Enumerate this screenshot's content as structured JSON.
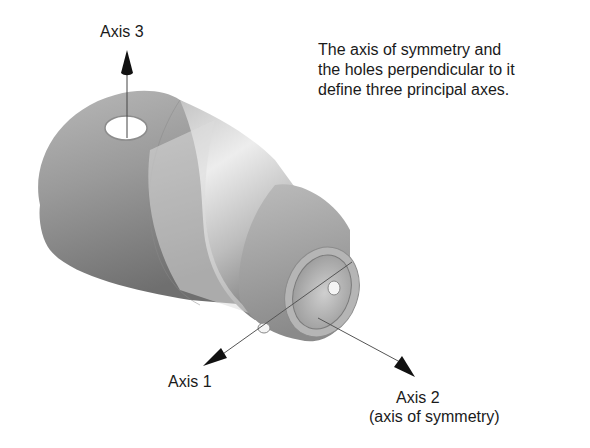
{
  "labels": {
    "axis3": "Axis 3",
    "axis1": "Axis 1",
    "axis2": "Axis 2",
    "axis2_sub": "(axis of symmetry)"
  },
  "caption": {
    "lines": [
      "The axis of symmetry and",
      "the holes perpendicular to it",
      "define three principal axes."
    ]
  },
  "colors": {
    "part_light": "#e6e6e6",
    "part_mid": "#a8a8a8",
    "part_dark": "#6e6e6e",
    "axis_line": "#555555",
    "arrowhead": "#111111"
  }
}
